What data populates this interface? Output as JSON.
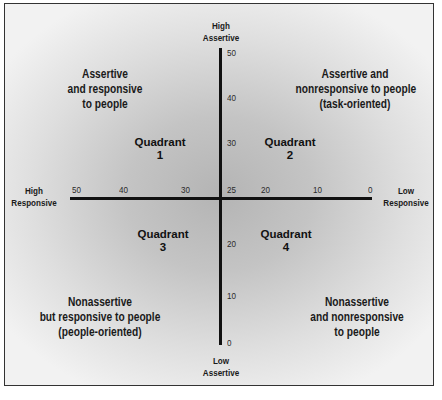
{
  "diagram": {
    "type": "quadrant",
    "axes": {
      "vertical": {
        "top_label": [
          "High",
          "Assertive"
        ],
        "bottom_label": [
          "Low",
          "Assertive"
        ],
        "ticks": [
          "50",
          "40",
          "30",
          "25",
          "20",
          "10",
          "0"
        ]
      },
      "horizontal": {
        "left_label": [
          "High",
          "Responsive"
        ],
        "right_label": [
          "Low",
          "Responsive"
        ],
        "ticks": [
          "50",
          "40",
          "30",
          "25",
          "20",
          "10",
          "0"
        ]
      }
    },
    "quadrants": [
      {
        "title": "Quadrant",
        "number": "1",
        "description": [
          "Assertive",
          "and responsive",
          "to people"
        ]
      },
      {
        "title": "Quadrant",
        "number": "2",
        "description": [
          "Assertive and",
          "nonresponsive to people",
          "(task-oriented)"
        ]
      },
      {
        "title": "Quadrant",
        "number": "3",
        "description": [
          "Nonassertive",
          "but responsive to people",
          "(people-oriented)"
        ]
      },
      {
        "title": "Quadrant",
        "number": "4",
        "description": [
          "Nonassertive",
          "and nonresponsive",
          "to people"
        ]
      }
    ],
    "colors": {
      "axis": "#111111",
      "text": "#1a1a1a",
      "border": "#333333",
      "background_center": "#b4b4b4",
      "background_edge": "#f2f2f2"
    }
  }
}
